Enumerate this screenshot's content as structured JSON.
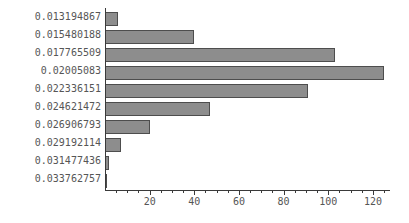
{
  "chart_data": {
    "type": "bar",
    "orientation": "horizontal",
    "title": "",
    "xlabel": "",
    "ylabel": "",
    "categories": [
      "0.013194867",
      "0.015480188",
      "0.017765509",
      "0.02005083",
      "0.022336151",
      "0.024621472",
      "0.026906793",
      "0.029192114",
      "0.031477436",
      "0.033762757"
    ],
    "values": [
      6,
      40,
      103,
      125,
      91,
      47,
      20,
      7,
      2,
      1
    ],
    "xlim": [
      0,
      128
    ],
    "xticks": [
      20,
      40,
      60,
      80,
      100,
      120
    ],
    "xticklabels": [
      "20",
      "40",
      "60",
      "80",
      "100",
      "120"
    ],
    "xminor_tick_step": 5,
    "grid": false,
    "legend": null,
    "bar_color": "#8d8d8d",
    "bar_edge_color": "#4d4d4d",
    "axis_color": "#3a3a3a",
    "label_color": "#565656"
  }
}
